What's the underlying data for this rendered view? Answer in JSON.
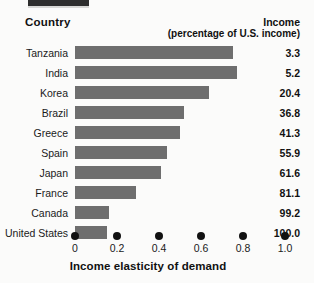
{
  "header": {
    "country_label": "Country",
    "income_label": "Income",
    "income_sublabel": "(percentage of U.S. income)"
  },
  "axis": {
    "title": "Income elasticity of demand"
  },
  "colors": {
    "bar": "#6e6e6e",
    "text": "#1a1a1a",
    "tick": "#111111",
    "background": "#fbfbfa"
  },
  "chart_data": {
    "type": "bar",
    "orientation": "horizontal",
    "title": "",
    "subtitle": "",
    "xlabel": "Income elasticity of demand",
    "ylabel": "Country",
    "xlim": [
      0,
      1.0
    ],
    "grid": false,
    "legend": null,
    "xticks": [
      "0",
      "0.2",
      "0.4",
      "0.6",
      "0.8",
      "1.0"
    ],
    "xtick_values": [
      0,
      0.2,
      0.4,
      0.6,
      0.8,
      1.0
    ],
    "categories": [
      "Tanzania",
      "India",
      "Korea",
      "Brazil",
      "Greece",
      "Spain",
      "Japan",
      "France",
      "Canada",
      "United States"
    ],
    "values": [
      0.75,
      0.77,
      0.64,
      0.52,
      0.5,
      0.44,
      0.41,
      0.29,
      0.16,
      0.15
    ],
    "series": [
      {
        "name": "Income elasticity of demand",
        "values": [
          0.75,
          0.77,
          0.64,
          0.52,
          0.5,
          0.44,
          0.41,
          0.29,
          0.16,
          0.15
        ]
      }
    ],
    "annotations": {
      "column_name": "Income (percentage of U.S. income)",
      "column_values": [
        "3.3",
        "5.2",
        "20.4",
        "36.8",
        "41.3",
        "55.9",
        "61.6",
        "81.1",
        "99.2",
        "100.0"
      ]
    }
  }
}
